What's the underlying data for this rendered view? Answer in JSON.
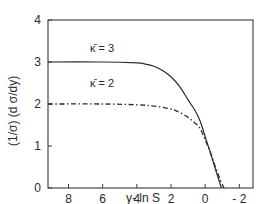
{
  "chart_data": {
    "type": "line",
    "title": "",
    "xlabel": "y- ln S",
    "ylabel": "(1/σ) (d σ/dy)",
    "xlim": [
      9.2,
      -2.8
    ],
    "ylim": [
      0,
      4
    ],
    "x_ticks": [
      8,
      6,
      4,
      2,
      0,
      -2
    ],
    "x_tick_labels": [
      "8",
      "6",
      "4",
      "2",
      "0",
      "- 2"
    ],
    "y_ticks": [
      0,
      1,
      2,
      3,
      4
    ],
    "y_tick_labels": [
      "0",
      "1",
      "2",
      "3",
      "4"
    ],
    "grid": false,
    "legend": "inline labels above curves",
    "series": [
      {
        "name": "κ̄ = 3",
        "style": "solid",
        "x": [
          9.2,
          6,
          4,
          3.5,
          3,
          2.5,
          2,
          1.5,
          1,
          0.6,
          0.3,
          0,
          -0.3,
          -0.6,
          -0.95
        ],
        "y": [
          3.0,
          3.0,
          2.98,
          2.95,
          2.9,
          2.8,
          2.65,
          2.42,
          2.1,
          1.85,
          1.6,
          1.22,
          0.85,
          0.45,
          0.0
        ]
      },
      {
        "name": "κ̄ = 2",
        "style": "dash-dot",
        "x": [
          9.2,
          6,
          4,
          3,
          2,
          1.5,
          1,
          0.6,
          0.3,
          0,
          -0.3,
          -0.6,
          -0.9,
          -1.1
        ],
        "y": [
          2.0,
          2.0,
          1.98,
          1.95,
          1.88,
          1.8,
          1.68,
          1.55,
          1.42,
          1.15,
          0.85,
          0.5,
          0.18,
          0.0
        ]
      }
    ]
  },
  "labels": {
    "curve3": "κ̄ = 3",
    "curve2": "κ̄ = 2",
    "xlabel": "y-  ln  S",
    "ylabel": "(1/σ) (d σ/dy)"
  }
}
